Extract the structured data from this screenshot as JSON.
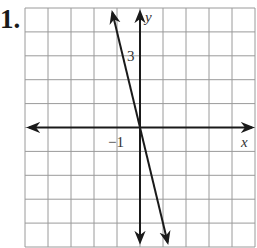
{
  "problem_number": "1.",
  "chart_data": {
    "type": "line",
    "title": "",
    "xlabel": "x",
    "ylabel": "y",
    "xlim": [
      -5,
      5
    ],
    "ylim": [
      -5,
      5
    ],
    "grid": true,
    "tick_labels": [
      {
        "axis": "x",
        "value": -1,
        "text": "−1"
      },
      {
        "axis": "y",
        "value": 3,
        "text": "3"
      }
    ],
    "series": [
      {
        "name": "line",
        "equation": "y = -4x",
        "x": [
          -1.2,
          0,
          1.2
        ],
        "y": [
          4.8,
          0,
          -4.8
        ]
      }
    ]
  }
}
